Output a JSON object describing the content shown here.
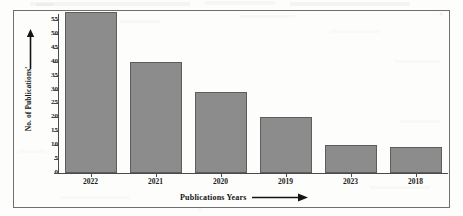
{
  "chart_data": {
    "type": "bar",
    "title": "",
    "subtitle": "",
    "xlabel": "Publications Years",
    "ylabel": "No. of Publications'",
    "categories": [
      "2022",
      "2021",
      "2020",
      "2019",
      "2023",
      "2018"
    ],
    "values": [
      58,
      40,
      29,
      20,
      10,
      9.5
    ],
    "series": [
      {
        "name": "No. of Publications",
        "values": [
          58,
          40,
          29,
          20,
          10,
          9.5
        ]
      }
    ],
    "yticks": [
      0,
      5,
      10,
      15,
      20,
      25,
      30,
      35,
      40,
      45,
      50,
      55
    ],
    "ytick_labels": [
      "0",
      "5",
      "10",
      "15",
      "20",
      "25",
      "30",
      "35",
      "40",
      "45",
      "50",
      "55"
    ],
    "ylim": [
      0,
      58
    ],
    "xtick_labels": [
      "2022",
      "2021",
      "2020",
      "2019",
      "2023",
      "2018"
    ],
    "grid": false,
    "legend": false,
    "legend_position": "none",
    "bar_color": "#8c8c8c",
    "bar_edge_color": "#5d5d5d",
    "axis_color": "#4a4a4a",
    "text_color": "#1c1c1c",
    "background_color": "#ffffff",
    "frame_color": "#6f6f6f",
    "annotations": {
      "y_axis_arrow": "up-arrow",
      "x_axis_arrow": "right-arrow"
    }
  }
}
